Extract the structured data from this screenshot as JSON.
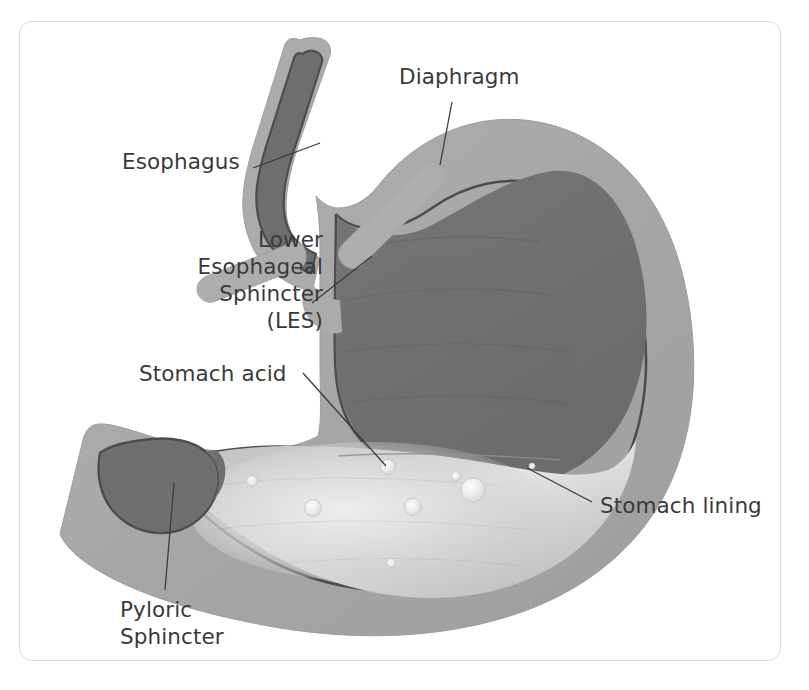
{
  "figure": {
    "frame": {
      "border_color": "#d8d8d8",
      "background": "#ffffff"
    }
  },
  "palette": {
    "outer_wall": "#a9a9a9",
    "outer_wall_light": "#b4b4b4",
    "muscle_mid": "#9a9a9a",
    "cavity_dark": "#707070",
    "cavity_darker": "#6a6a6a",
    "mucosa_line": "#4a4a4a",
    "acid_light": "#cfcfcf",
    "acid_pale": "#e2e2e2",
    "bubble": "#f2f2f2",
    "leader_line": "#3c3c3c",
    "text": "#3a3a3a"
  },
  "labels": [
    {
      "id": "diaphragm",
      "text": "Diaphragm",
      "align": "left",
      "x": 399,
      "y": 63,
      "leader": {
        "from": [
          452,
          102
        ],
        "to": [
          440,
          165
        ]
      }
    },
    {
      "id": "esophagus",
      "text": "Esophagus",
      "align": "left",
      "x": 122,
      "y": 148,
      "leader": {
        "from": [
          253,
          168
        ],
        "to": [
          320,
          143
        ]
      }
    },
    {
      "id": "lower-esophageal-sphincter",
      "text": "Lower\nEsophageal\nSphincter (LES)",
      "align": "right",
      "x": 178,
      "y": 226,
      "width": 145,
      "leader": {
        "from": [
          312,
          303
        ],
        "to": [
          372,
          256
        ]
      }
    },
    {
      "id": "stomach-acid",
      "text": "Stomach acid",
      "align": "left",
      "x": 139,
      "y": 360,
      "leader": {
        "from": [
          303,
          373
        ],
        "to": [
          386,
          466
        ]
      }
    },
    {
      "id": "stomach-lining",
      "text": "Stomach lining",
      "align": "left",
      "x": 600,
      "y": 492,
      "leader": {
        "from": [
          592,
          502
        ],
        "to": [
          527,
          468
        ]
      }
    },
    {
      "id": "pyloric-sphincter",
      "text": "Pyloric\nSphincter",
      "align": "left",
      "x": 120,
      "y": 596,
      "leader": {
        "from": [
          165,
          590
        ],
        "to": [
          174,
          483
        ]
      }
    }
  ],
  "acid_bubbles": [
    {
      "cx": 388,
      "cy": 467,
      "r": 7.5
    },
    {
      "cx": 252,
      "cy": 481,
      "r": 5.5
    },
    {
      "cx": 313,
      "cy": 508,
      "r": 8.5
    },
    {
      "cx": 413,
      "cy": 507,
      "r": 8.5
    },
    {
      "cx": 456,
      "cy": 476,
      "r": 4.5
    },
    {
      "cx": 473,
      "cy": 490,
      "r": 12.0
    },
    {
      "cx": 391,
      "cy": 563,
      "r": 4.5
    },
    {
      "cx": 532,
      "cy": 466,
      "r": 3.0
    }
  ],
  "structures": [
    {
      "id": "esophagus-tube",
      "name": "Esophagus"
    },
    {
      "id": "diaphragm-right-arm",
      "name": "Diaphragm (right crus)"
    },
    {
      "id": "diaphragm-left-arm",
      "name": "Diaphragm (left crus)"
    },
    {
      "id": "stomach-body",
      "name": "Stomach"
    },
    {
      "id": "stomach-cavity",
      "name": "Stomach cavity"
    },
    {
      "id": "acid-pool",
      "name": "Stomach acid pool"
    },
    {
      "id": "duodenum-bulb",
      "name": "Duodenum"
    },
    {
      "id": "pylorus",
      "name": "Pyloric sphincter"
    }
  ]
}
